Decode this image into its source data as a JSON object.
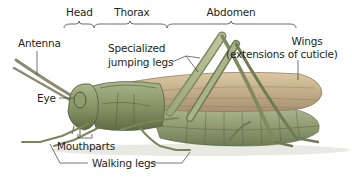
{
  "diagram": {
    "regions": [
      {
        "label": "Head",
        "bracket_from_x": 64,
        "bracket_to_x": 94
      },
      {
        "label": "Thorax",
        "bracket_from_x": 94,
        "bracket_to_x": 167
      },
      {
        "label": "Abdomen",
        "bracket_from_x": 167,
        "bracket_to_x": 296
      }
    ],
    "labels": {
      "antenna": "Antenna",
      "specialized_legs_line1": "Specialized",
      "specialized_legs_line2": "jumping legs",
      "wings_line1": "Wings",
      "wings_line2": "(extensions of cuticle)",
      "eye": "Eye",
      "mouthparts": "Mouthparts",
      "walking_legs": "Walking legs"
    },
    "colors": {
      "text": "#231f20",
      "leader_line": "#3a3a3a",
      "body_green": "#8a9a6a",
      "body_dark": "#5f6e48",
      "wing_tan": "#c9b48e",
      "wing_dark": "#a48e66",
      "abdomen": "#9aa57c"
    }
  }
}
